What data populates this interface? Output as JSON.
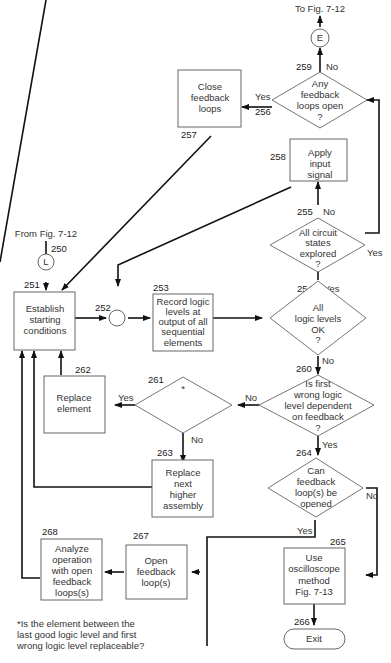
{
  "figure": {
    "top_exit": "To Fig. 7-12",
    "top_entry": "From Fig. 7-12",
    "connectors": {
      "E": "E",
      "L": "L"
    },
    "footnote": [
      "*Is the element between the",
      "last good logic level and first",
      "wrong logic level replaceable?"
    ]
  },
  "nodes": {
    "n250": {
      "id": "250"
    },
    "n251": {
      "id": "251",
      "lines": [
        "Establish",
        "starting",
        "conditions"
      ]
    },
    "n252": {
      "id": "252"
    },
    "n253": {
      "id": "253",
      "lines": [
        "Record logic",
        "levels at",
        "output of all",
        "sequential",
        "elements"
      ]
    },
    "n254": {
      "id": "254",
      "lines": [
        "All",
        "logic levels",
        "OK",
        "?"
      ]
    },
    "n255": {
      "id": "255",
      "lines": [
        "All  circuit",
        "states",
        "explored",
        "?"
      ]
    },
    "n256": {
      "id": "256",
      "lines": [
        "Any",
        "feedback",
        "loops open",
        "?"
      ]
    },
    "n257": {
      "id": "257",
      "lines": [
        "Close",
        "feedback",
        "loops"
      ]
    },
    "n258": {
      "id": "258",
      "lines": [
        "Apply",
        "input",
        "signal"
      ]
    },
    "n259": {
      "id": "259"
    },
    "n260": {
      "id": "260",
      "lines": [
        "Is   first",
        "wrong logic",
        "level dependent",
        "on feedback",
        "?"
      ]
    },
    "n261": {
      "id": "261",
      "lines": [
        "*"
      ]
    },
    "n262": {
      "id": "262",
      "lines": [
        "Replace",
        "element"
      ]
    },
    "n263": {
      "id": "263",
      "lines": [
        "Replace",
        "next",
        "higher",
        "assembly"
      ]
    },
    "n264": {
      "id": "264",
      "lines": [
        "Can",
        "feedback",
        "loop(s) be",
        "opened"
      ]
    },
    "n265": {
      "id": "265",
      "lines": [
        "Use",
        "oscilloscope",
        "method",
        "Fig. 7-13"
      ]
    },
    "n266": {
      "id": "266",
      "lines": [
        "Exit"
      ]
    },
    "n267": {
      "id": "267",
      "lines": [
        "Open",
        "feedback",
        "loop(s)"
      ]
    },
    "n268": {
      "id": "268",
      "lines": [
        "Analyze",
        "operation",
        "with open",
        "feedback",
        "loops(s)"
      ]
    }
  },
  "edge_labels": {
    "yes": "Yes",
    "no": "No"
  }
}
